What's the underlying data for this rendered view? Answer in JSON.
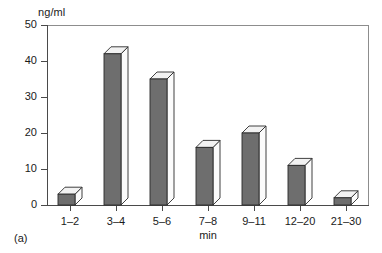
{
  "figure": {
    "sub_label": "(a)"
  },
  "chart_data": {
    "type": "bar",
    "title": "",
    "subtitle": "",
    "xlabel": "min",
    "ylabel": "ng/ml",
    "categories": [
      "1–2",
      "3–4",
      "5–6",
      "7–8",
      "9–11",
      "12–20",
      "21–30"
    ],
    "values": [
      3,
      42,
      35,
      16,
      20,
      11,
      2
    ],
    "series": [
      {
        "name": "concentration",
        "values": [
          3,
          42,
          35,
          16,
          20,
          11,
          2
        ]
      }
    ],
    "ylim": [
      0,
      50
    ],
    "yticks": [
      0,
      10,
      20,
      30,
      40,
      50
    ],
    "ytick_labels": [
      "0",
      "10",
      "20",
      "30",
      "40",
      "50"
    ],
    "grid": false,
    "legend": "none",
    "style": "3d-bars",
    "annotations": [],
    "colors": {
      "bar_front": "#6e6e6e",
      "bar_top": "#f2f2f2",
      "bar_side": "#fbfbfb",
      "bar_outline": "#2b2b2b",
      "axis": "#4a4a4a",
      "frame": "#8d8d8d",
      "background": "#ffffff",
      "text": "#1a1a1a"
    }
  }
}
